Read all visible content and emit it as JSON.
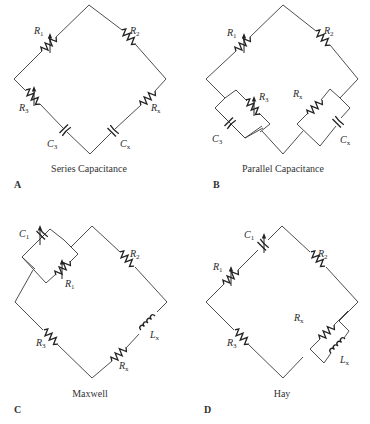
{
  "figure": {
    "panels": [
      {
        "id": "A",
        "letter": "A",
        "caption": "Series Capacitance",
        "components": [
          {
            "name": "R1",
            "base": "R",
            "sub": "1",
            "type": "variable-resistor"
          },
          {
            "name": "R2",
            "base": "R",
            "sub": "2",
            "type": "resistor"
          },
          {
            "name": "R3",
            "base": "R",
            "sub": "3",
            "type": "variable-resistor"
          },
          {
            "name": "Rx",
            "base": "R",
            "sub": "x",
            "type": "resistor"
          },
          {
            "name": "C3",
            "base": "C",
            "sub": "3",
            "type": "capacitor"
          },
          {
            "name": "Cx",
            "base": "C",
            "sub": "x",
            "type": "capacitor"
          }
        ]
      },
      {
        "id": "B",
        "letter": "B",
        "caption": "Parallel Capacitance",
        "components": [
          {
            "name": "R1",
            "base": "R",
            "sub": "1",
            "type": "variable-resistor"
          },
          {
            "name": "R2",
            "base": "R",
            "sub": "2",
            "type": "resistor"
          },
          {
            "name": "R3",
            "base": "R",
            "sub": "3",
            "type": "variable-resistor"
          },
          {
            "name": "Rx",
            "base": "R",
            "sub": "x",
            "type": "resistor"
          },
          {
            "name": "C3",
            "base": "C",
            "sub": "3",
            "type": "capacitor"
          },
          {
            "name": "Cx",
            "base": "C",
            "sub": "x",
            "type": "capacitor"
          }
        ]
      },
      {
        "id": "C",
        "letter": "C",
        "caption": "Maxwell",
        "components": [
          {
            "name": "C1",
            "base": "C",
            "sub": "1",
            "type": "variable-capacitor"
          },
          {
            "name": "R1",
            "base": "R",
            "sub": "1",
            "type": "variable-resistor"
          },
          {
            "name": "R2",
            "base": "R",
            "sub": "2",
            "type": "resistor"
          },
          {
            "name": "R3",
            "base": "R",
            "sub": "3",
            "type": "resistor"
          },
          {
            "name": "Rx",
            "base": "R",
            "sub": "x",
            "type": "resistor"
          },
          {
            "name": "Lx",
            "base": "L",
            "sub": "x",
            "type": "inductor"
          }
        ]
      },
      {
        "id": "D",
        "letter": "D",
        "caption": "Hay",
        "components": [
          {
            "name": "C1",
            "base": "C",
            "sub": "1",
            "type": "variable-capacitor"
          },
          {
            "name": "R1",
            "base": "R",
            "sub": "1",
            "type": "variable-resistor"
          },
          {
            "name": "R2",
            "base": "R",
            "sub": "2",
            "type": "resistor"
          },
          {
            "name": "R3",
            "base": "R",
            "sub": "3",
            "type": "resistor"
          },
          {
            "name": "Rx",
            "base": "R",
            "sub": "x",
            "type": "resistor"
          },
          {
            "name": "Lx",
            "base": "L",
            "sub": "x",
            "type": "inductor"
          }
        ]
      }
    ]
  }
}
